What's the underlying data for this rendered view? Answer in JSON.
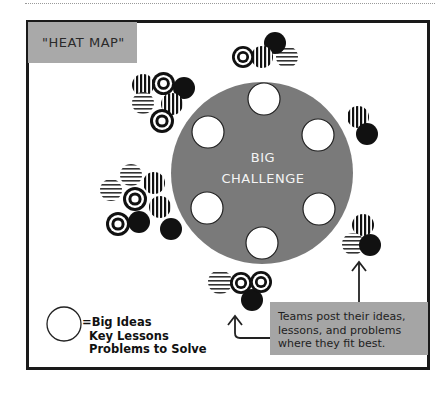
{
  "diagram": {
    "title": "\"HEAT MAP\"",
    "center": {
      "line1": "BIG",
      "line2": "CHALLENGE"
    },
    "legend": {
      "symbol": "open-circle",
      "line1": "=Big Ideas",
      "line2": "Key Lessons",
      "line3": "Problems to Solve"
    },
    "callout": {
      "line1": "Teams post their ideas,",
      "line2": "lessons, and problems",
      "line3": "where they fit best."
    },
    "colors": {
      "frame": "#1a1a1a",
      "title_box": "#a9a9a9",
      "big_circle": "#7a7a7a",
      "callout_box": "#a5a5a5",
      "dot_black": "#111111"
    },
    "slot_count": 6,
    "cluster_types": [
      "target",
      "vertical-stripes",
      "horizontal-stripes",
      "solid-black"
    ]
  }
}
